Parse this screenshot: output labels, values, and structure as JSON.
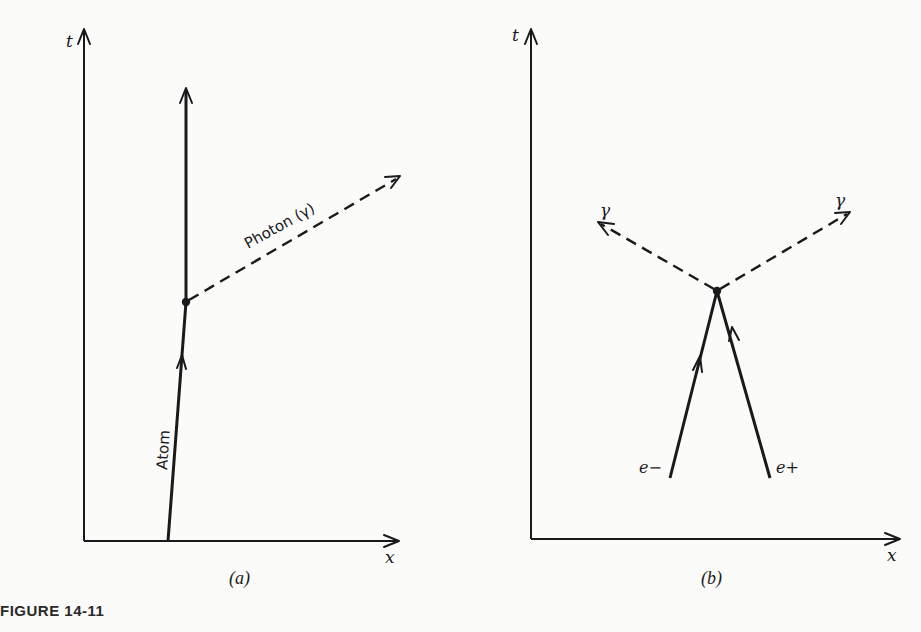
{
  "figure": {
    "title": "FIGURE 14-11",
    "panels": [
      {
        "id": "a",
        "caption": "(a)",
        "axes": {
          "x_label": "x",
          "t_label": "t"
        },
        "worldlines": [
          {
            "name": "atom",
            "label": "Atom",
            "style": "solid"
          },
          {
            "name": "photon",
            "label": "Photon (γ)",
            "style": "dashed"
          }
        ]
      },
      {
        "id": "b",
        "caption": "(b)",
        "axes": {
          "x_label": "x",
          "t_label": "t"
        },
        "worldlines": [
          {
            "name": "electron",
            "label": "e−",
            "style": "solid"
          },
          {
            "name": "positron",
            "label": "e+",
            "style": "solid"
          },
          {
            "name": "photon-left",
            "label": "γ",
            "style": "dashed"
          },
          {
            "name": "photon-right",
            "label": "γ",
            "style": "dashed"
          }
        ]
      }
    ]
  },
  "colors": {
    "ink": "#1a1a1a",
    "paper": "#fbfbfa"
  }
}
